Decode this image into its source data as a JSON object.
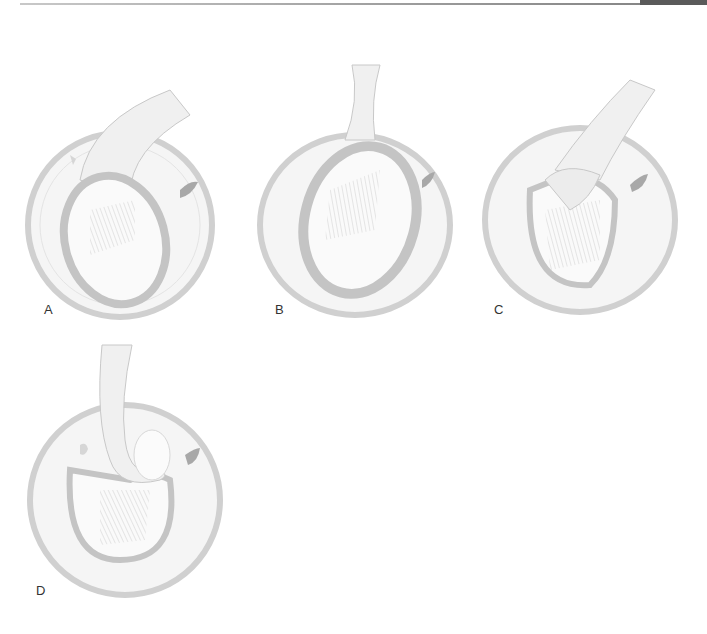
{
  "figure": {
    "panels": [
      {
        "label": "A",
        "description": "tendon sheath looped over oval structure, tendon exiting upper right"
      },
      {
        "label": "B",
        "description": "tendon sheath enclosing oval structure, tendon exiting upward"
      },
      {
        "label": "C",
        "description": "sheath opened with tendon folding into oval structure"
      },
      {
        "label": "D",
        "description": "tendon entering from top and curling into oval structure"
      }
    ]
  },
  "colors": {
    "outline": "#c4c4c4",
    "fill_light": "#f3f3f3",
    "shade": "#d9d9d9",
    "dark_spot": "#a8a8a8",
    "rule": "#9a9a9a",
    "tab": "#5a5a5a"
  }
}
